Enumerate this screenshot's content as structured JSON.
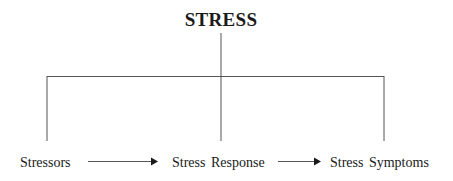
{
  "diagram": {
    "title": "STRESS",
    "nodes": [
      {
        "label": "Stressors"
      },
      {
        "label": "Stress Response"
      },
      {
        "label": "Stress Symptoms"
      }
    ],
    "edges": [
      {
        "from": "Stressors",
        "to": "Stress Response",
        "type": "arrow"
      },
      {
        "from": "Stress Response",
        "to": "Stress Symptoms",
        "type": "arrow"
      }
    ],
    "colors": {
      "line": "#555555",
      "text": "#1a1a1a",
      "background": "#ffffff"
    }
  }
}
